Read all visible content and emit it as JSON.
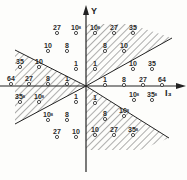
{
  "axes": {
    "y_label": "Y",
    "x_label": "I₃",
    "origin": [
      86,
      86
    ]
  },
  "regions": [
    {
      "name": "left-wedge",
      "points": [
        [
          86,
          86
        ],
        [
          15,
          50
        ],
        [
          15,
          124
        ]
      ]
    },
    {
      "name": "upper-right-wedge",
      "points": [
        [
          86,
          86
        ],
        [
          86,
          24
        ],
        [
          130,
          24
        ],
        [
          172,
          38
        ]
      ]
    },
    {
      "name": "lower-right-wedge",
      "points": [
        [
          86,
          86
        ],
        [
          169,
          138
        ],
        [
          140,
          150
        ],
        [
          86,
          150
        ]
      ]
    }
  ],
  "points": [
    {
      "label": "27",
      "sup": "",
      "x": 57,
      "y": 31
    },
    {
      "label": "10",
      "sup": "8",
      "x": 76,
      "y": 31
    },
    {
      "label": "10",
      "sup": "",
      "x": 48,
      "y": 49
    },
    {
      "label": "8",
      "sup": "",
      "x": 67,
      "y": 49
    },
    {
      "label": "1",
      "sup": "",
      "x": 76,
      "y": 67
    },
    {
      "label": "35",
      "sup": "",
      "x": 20,
      "y": 65
    },
    {
      "label": "10",
      "sup": "",
      "x": 39,
      "y": 65
    },
    {
      "label": "64",
      "sup": "",
      "x": 11,
      "y": 82
    },
    {
      "label": "27",
      "sup": "",
      "x": 29,
      "y": 82
    },
    {
      "label": "8",
      "sup": "",
      "x": 48,
      "y": 82
    },
    {
      "label": "1",
      "sup": "",
      "x": 67,
      "y": 82
    },
    {
      "label": "35",
      "sup": "8",
      "x": 20,
      "y": 100
    },
    {
      "label": "10",
      "sup": "8",
      "x": 39,
      "y": 100
    },
    {
      "label": "1",
      "sup": "",
      "x": 76,
      "y": 100
    },
    {
      "label": "10",
      "sup": "8",
      "x": 48,
      "y": 118
    },
    {
      "label": "8",
      "sup": "",
      "x": 67,
      "y": 118
    },
    {
      "label": "27",
      "sup": "",
      "x": 57,
      "y": 135
    },
    {
      "label": "10",
      "sup": "",
      "x": 76,
      "y": 135
    },
    {
      "label": "10",
      "sup": "8",
      "x": 95,
      "y": 31
    },
    {
      "label": "27",
      "sup": "",
      "x": 114,
      "y": 31
    },
    {
      "label": "35",
      "sup": "",
      "x": 133,
      "y": 31
    },
    {
      "label": "8",
      "sup": "",
      "x": 105,
      "y": 49
    },
    {
      "label": "10",
      "sup": "",
      "x": 124,
      "y": 49
    },
    {
      "label": "1",
      "sup": "",
      "x": 95,
      "y": 67
    },
    {
      "label": "10",
      "sup": "",
      "x": 133,
      "y": 67
    },
    {
      "label": "35",
      "sup": "",
      "x": 152,
      "y": 67
    },
    {
      "label": "1",
      "sup": "",
      "x": 105,
      "y": 83
    },
    {
      "label": "8",
      "sup": "",
      "x": 124,
      "y": 83
    },
    {
      "label": "27",
      "sup": "",
      "x": 143,
      "y": 83
    },
    {
      "label": "64",
      "sup": "",
      "x": 162,
      "y": 83
    },
    {
      "label": "10",
      "sup": "8",
      "x": 134,
      "y": 98
    },
    {
      "label": "35",
      "sup": "8",
      "x": 152,
      "y": 98
    },
    {
      "label": "1",
      "sup": "",
      "x": 95,
      "y": 101
    },
    {
      "label": "8",
      "sup": "",
      "x": 105,
      "y": 117
    },
    {
      "label": "10",
      "sup": "8",
      "x": 124,
      "y": 114
    },
    {
      "label": "10",
      "sup": "",
      "x": 95,
      "y": 133
    },
    {
      "label": "27",
      "sup": "",
      "x": 114,
      "y": 133
    },
    {
      "label": "35",
      "sup": "8",
      "x": 133,
      "y": 133
    }
  ]
}
